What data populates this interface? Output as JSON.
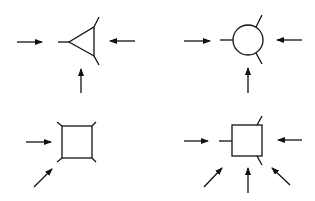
{
  "diagram": {
    "colors": {
      "stroke": "#111111",
      "background": "#ffffff"
    },
    "panels": [
      {
        "id": "triangle-vertex",
        "shape": "triangle",
        "shape_points": [
          [
            69,
            42
          ],
          [
            94,
            27
          ],
          [
            94,
            56
          ]
        ],
        "legs": [
          [
            [
              58,
              42
            ],
            [
              69,
              42
            ]
          ],
          [
            [
              94,
              27
            ],
            [
              99,
              17
            ]
          ],
          [
            [
              94,
              56
            ],
            [
              99,
              65
            ]
          ]
        ],
        "arrows": [
          [
            [
              17,
              42
            ],
            [
              42,
              42
            ]
          ],
          [
            [
              135,
              41
            ],
            [
              110,
              41
            ]
          ],
          [
            [
              81,
              93
            ],
            [
              81,
              69
            ]
          ]
        ]
      },
      {
        "id": "circle-vertex",
        "shape": "circle",
        "circle": {
          "cx": 248,
          "cy": 40,
          "r": 15
        },
        "legs": [
          [
            [
              220,
              40
            ],
            [
              233,
              40
            ]
          ],
          [
            [
              256,
              27
            ],
            [
              262,
              15
            ]
          ],
          [
            [
              256,
              53
            ],
            [
              262,
              64
            ]
          ]
        ],
        "arrows": [
          [
            [
              184,
              41
            ],
            [
              210,
              41
            ]
          ],
          [
            [
              302,
              40
            ],
            [
              277,
              40
            ]
          ],
          [
            [
              248,
              93
            ],
            [
              248,
              68
            ]
          ]
        ]
      },
      {
        "id": "square-vertex",
        "shape": "square",
        "rect": {
          "x": 62,
          "y": 126,
          "w": 30,
          "h": 32
        },
        "legs": [
          [
            [
              57,
              122
            ],
            [
              62,
              126
            ]
          ],
          [
            [
              92,
              126
            ],
            [
              96,
              122
            ]
          ],
          [
            [
              57,
              162
            ],
            [
              62,
              158
            ]
          ],
          [
            [
              92,
              158
            ],
            [
              96,
              162
            ]
          ]
        ],
        "arrows": [
          [
            [
              26,
              142
            ],
            [
              51,
              142
            ]
          ],
          [
            [
              34,
              187
            ],
            [
              52,
              169
            ]
          ]
        ]
      },
      {
        "id": "box-vertex",
        "shape": "box",
        "rect": {
          "x": 232,
          "y": 125,
          "w": 30,
          "h": 31
        },
        "legs": [
          [
            [
              219,
              141
            ],
            [
              232,
              141
            ]
          ],
          [
            [
              257,
              125
            ],
            [
              262,
              116
            ]
          ],
          [
            [
              257,
              156
            ],
            [
              262,
              165
            ]
          ]
        ],
        "arrows": [
          [
            [
              184,
              141
            ],
            [
              208,
              141
            ]
          ],
          [
            [
              302,
              140
            ],
            [
              278,
              140
            ]
          ],
          [
            [
              204,
              187
            ],
            [
              222,
              168
            ]
          ],
          [
            [
              248,
              193
            ],
            [
              248,
              168
            ]
          ],
          [
            [
              290,
              185
            ],
            [
              272,
              168
            ]
          ]
        ]
      }
    ]
  }
}
